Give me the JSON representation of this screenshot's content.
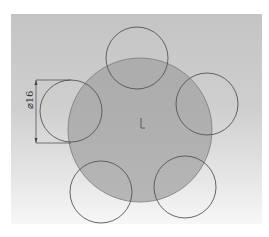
{
  "diagram": {
    "type": "cad-sketch",
    "background_colors": {
      "top": "#c4c4c4",
      "bottom": "#f7f7f7"
    },
    "main_circle": {
      "cx": 140,
      "cy": 130,
      "r": 72,
      "fill": "#a3a3a3",
      "stroke": "#7a7a7a"
    },
    "small_circles": [
      {
        "id": "top",
        "cx": 137,
        "cy": 58,
        "r": 31
      },
      {
        "id": "right",
        "cx": 207,
        "cy": 104,
        "r": 31
      },
      {
        "id": "bottom-right",
        "cx": 185,
        "cy": 187,
        "r": 31
      },
      {
        "id": "bottom-left",
        "cx": 101,
        "cy": 192,
        "r": 31
      },
      {
        "id": "left",
        "cx": 71,
        "cy": 111,
        "r": 31
      }
    ],
    "small_circle_stroke": "#555555",
    "dimension": {
      "label": "⌀16",
      "x": 36,
      "y_top": 80,
      "y_bottom": 143
    },
    "origin_marker": {
      "x": 141,
      "y": 123
    }
  }
}
